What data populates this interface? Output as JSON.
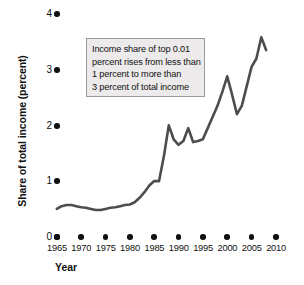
{
  "chart_data": {
    "type": "line",
    "title": "",
    "xlabel": "Year",
    "ylabel": "Share of total income (percent)",
    "xlim": [
      1965,
      2010
    ],
    "ylim": [
      0,
      4
    ],
    "grid": false,
    "legend": null,
    "line_color": "#4d4d4d",
    "annotations": [
      {
        "lines": [
          "Income share of top 0.01",
          "percent rises from less than",
          "1 percent to more than",
          "3 percent of total income"
        ]
      }
    ],
    "x_tick_labels": [
      "1965",
      "1970",
      "1975",
      "1980",
      "1985",
      "1990",
      "1995",
      "2000",
      "2005",
      "2010"
    ],
    "x_ticks": [
      1965,
      1970,
      1975,
      1980,
      1985,
      1990,
      1995,
      2000,
      2005,
      2010
    ],
    "y_tick_labels": [
      "0",
      "1",
      "2",
      "3",
      "4"
    ],
    "y_ticks": [
      0,
      1,
      2,
      3,
      4
    ],
    "series": [
      {
        "name": "Share of total income of top 0.01 percent",
        "x": [
          1965,
          1966,
          1967,
          1968,
          1969,
          1970,
          1971,
          1972,
          1973,
          1974,
          1975,
          1976,
          1977,
          1978,
          1979,
          1980,
          1981,
          1982,
          1983,
          1984,
          1985,
          1986,
          1987,
          1988,
          1989,
          1990,
          1991,
          1992,
          1993,
          1994,
          1995,
          1996,
          1997,
          1998,
          1999,
          2000,
          2001,
          2002,
          2003,
          2004,
          2005,
          2006,
          2007,
          2008
        ],
        "values": [
          0.5,
          0.55,
          0.57,
          0.57,
          0.55,
          0.53,
          0.52,
          0.5,
          0.48,
          0.48,
          0.5,
          0.52,
          0.53,
          0.55,
          0.57,
          0.58,
          0.62,
          0.7,
          0.8,
          0.92,
          1.0,
          1.0,
          1.45,
          2.0,
          1.75,
          1.65,
          1.72,
          1.95,
          1.7,
          1.72,
          1.75,
          1.95,
          2.15,
          2.35,
          2.6,
          2.88,
          2.55,
          2.2,
          2.35,
          2.7,
          3.05,
          3.2,
          3.58,
          3.35
        ]
      }
    ]
  },
  "axis": {
    "y_title": "Share of total income (percent)",
    "x_title": "Year"
  }
}
